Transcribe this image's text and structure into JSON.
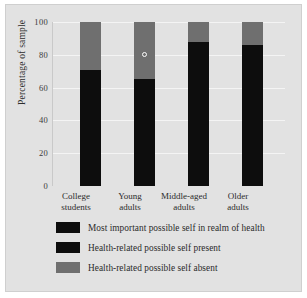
{
  "chart_data": {
    "type": "bar",
    "subtype": "stacked-100-percent",
    "title": "",
    "xlabel": "",
    "ylabel": "Percentage of sample",
    "ylim": [
      0,
      100
    ],
    "yticks": [
      0,
      20,
      40,
      60,
      80,
      100
    ],
    "ytick_labels": [
      "0",
      "20",
      "40",
      "60",
      "80",
      "100"
    ],
    "grid": true,
    "legend_position": "bottom-left",
    "categories": [
      "College\nstudents",
      "Young\nadults",
      "Middle-aged\nadults",
      "Older\nadults"
    ],
    "category_lines": [
      [
        "College",
        "students"
      ],
      [
        "Young",
        "adults"
      ],
      [
        "Middle-aged",
        "adults"
      ],
      [
        "Older",
        "adults"
      ]
    ],
    "series": [
      {
        "name": "Health-related possible self present",
        "color": "#0d0d0d",
        "values": [
          71,
          65,
          88,
          86
        ]
      },
      {
        "name": "Health-related possible self absent",
        "color": "#6f6f6f",
        "values": [
          29,
          35,
          12,
          14
        ]
      }
    ],
    "annotations": [
      {
        "label": "Most important possible self in realm of health",
        "category": "Young\nadults",
        "value": 80,
        "marker": "open-circle"
      }
    ]
  },
  "axis": {
    "y_title": "Percentage of sample",
    "y_ticks": [
      "100",
      "80",
      "60",
      "40",
      "20",
      "0"
    ],
    "x_labels": [
      {
        "line1": "College",
        "line2": "students"
      },
      {
        "line1": "Young",
        "line2": "adults"
      },
      {
        "line1": "Middle-aged",
        "line2": "adults"
      },
      {
        "line1": "Older",
        "line2": "adults"
      }
    ]
  },
  "legend": {
    "items": [
      {
        "label": "Most important possible self in realm of health",
        "color": "#0d0d0d"
      },
      {
        "label": "Health-related possible self present",
        "color": "#0d0d0d"
      },
      {
        "label": "Health-related possible self absent",
        "color": "#6f6f6f"
      }
    ]
  },
  "colors": {
    "figure_background": "#e2e2e2",
    "gridline": "#f4f4f4",
    "bar_dark": "#0d0d0d",
    "bar_gray": "#6f6f6f",
    "text": "#2b2b2b"
  }
}
